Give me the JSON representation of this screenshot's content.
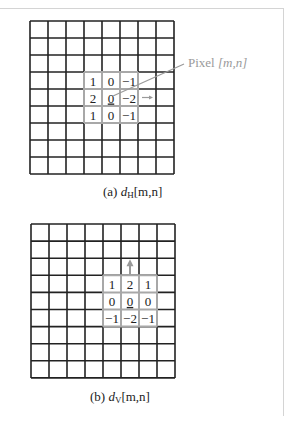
{
  "figure_a": {
    "caption_prefix": "(a) ",
    "caption_var": "d",
    "caption_sub": "H",
    "caption_args": "[m,n]",
    "grid": {
      "cols": 8,
      "rows": 9
    },
    "kernel_col_start": 4,
    "kernel_row_start": 3,
    "kernel": [
      [
        "1",
        "0",
        "−1"
      ],
      [
        "2",
        "0",
        "−2"
      ],
      [
        "1",
        "0",
        "−1"
      ]
    ],
    "center_underlined": true,
    "direction_arrow": "right",
    "pixel_label": "Pixel ",
    "pixel_label_args": "[m,n]"
  },
  "figure_b": {
    "caption_prefix": "(b) ",
    "caption_var": "d",
    "caption_sub": "V",
    "caption_args": "[m,n]",
    "grid": {
      "cols": 8,
      "rows": 9
    },
    "kernel_col_start": 4,
    "kernel_row_start": 3,
    "kernel": [
      [
        "1",
        "2",
        "1"
      ],
      [
        "0",
        "0",
        "0"
      ],
      [
        "−1",
        "−2",
        "−1"
      ]
    ],
    "center_underlined": true,
    "direction_arrow": "up"
  },
  "colors": {
    "grid_line": "#222222",
    "kernel_border": "#a8a8a8",
    "annotation": "#9a9a9a"
  }
}
